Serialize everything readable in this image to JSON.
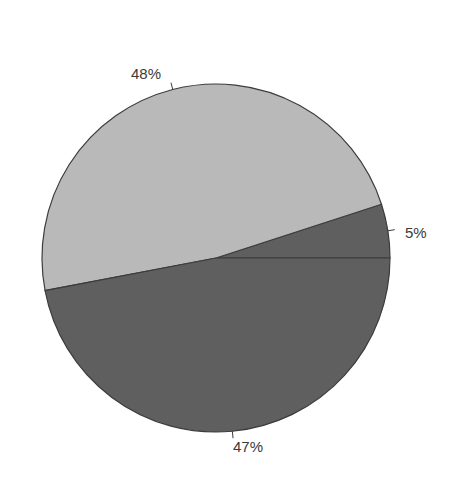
{
  "chart_data": {
    "type": "pie",
    "title": "",
    "categories": [
      "Slice A",
      "Slice B",
      "Slice C"
    ],
    "values": [
      5,
      48,
      47
    ],
    "labels": [
      "5%",
      "48%",
      "47%"
    ],
    "colors": [
      "#5f5f5f",
      "#b9b9b9",
      "#5f5f5f"
    ],
    "start_angle_deg": 0,
    "direction": "counterclockwise",
    "legend": "none",
    "label_position": "outside with leader ticks"
  },
  "labels": {
    "slice_a": "5%",
    "slice_b": "48%",
    "slice_c": "47%"
  },
  "colors": {
    "light_slice": "#b9b9b9",
    "dark_slice": "#5f5f5f",
    "outline": "#3c3c3c",
    "label_text": "#3a3a3a"
  }
}
